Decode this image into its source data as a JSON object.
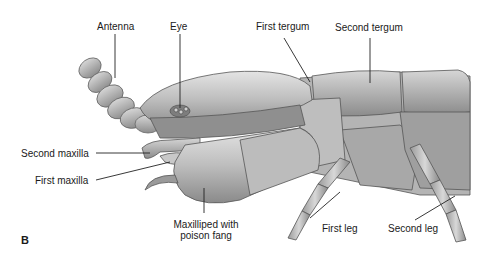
{
  "figure": {
    "panel_letter": "B"
  },
  "labels": {
    "antenna": "Antenna",
    "eye": "Eye",
    "first_tergum": "First tergum",
    "second_tergum": "Second tergum",
    "second_maxilla": "Second maxilla",
    "first_maxilla": "First maxilla",
    "maxilliped_line1": "Maxilliped with",
    "maxilliped_line2": "poison fang",
    "first_leg": "First leg",
    "second_leg": "Second leg"
  },
  "colors": {
    "body_light": "#d8d8d8",
    "body_mid": "#a9a9a9",
    "body_dark": "#6e6e6e",
    "outline": "#555555",
    "leader": "#222222"
  }
}
